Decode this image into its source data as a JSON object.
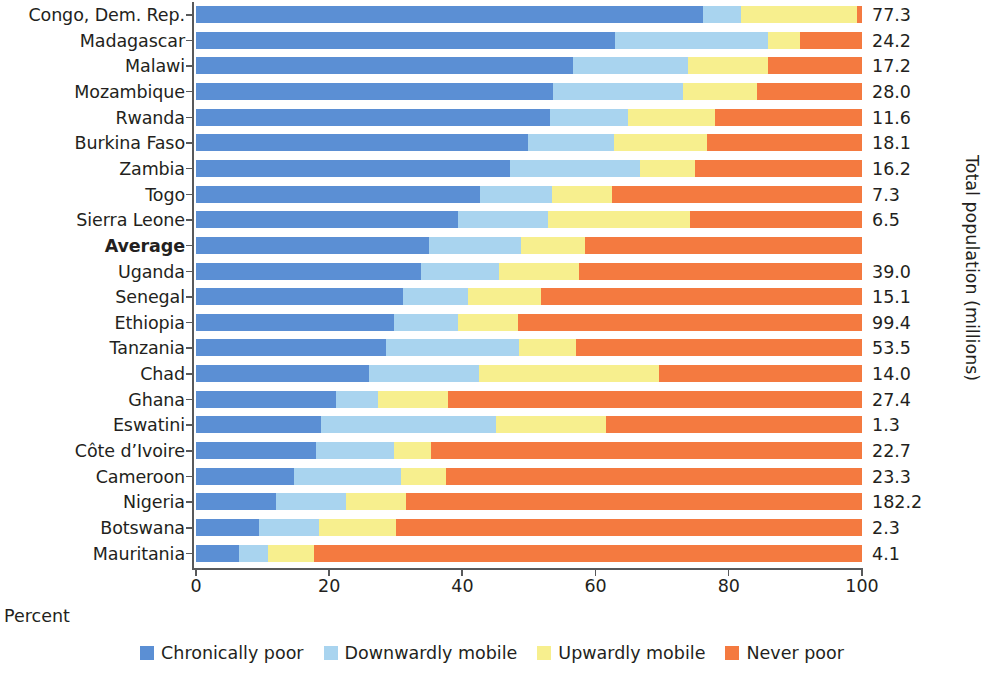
{
  "chart_data": {
    "type": "bar",
    "subtype": "horizontal-stacked-100",
    "title": "",
    "xlabel": "Percent",
    "ylabel": "",
    "y2label": "Total population (millions)",
    "xlim": [
      0,
      100
    ],
    "xticks": [
      0,
      20,
      40,
      60,
      80,
      100
    ],
    "xtick_labels": [
      "0",
      "20",
      "40",
      "60",
      "80",
      "100"
    ],
    "grid": false,
    "legend_position": "bottom",
    "colors": {
      "chronically_poor": "#5b8fd4",
      "downwardly_mobile": "#a9d4ef",
      "upwardly_mobile": "#f7ef8e",
      "never_poor": "#f47a40",
      "axis": "#58595b",
      "text": "#231f20"
    },
    "series": [
      {
        "name": "Chronically poor",
        "key": "chronically_poor",
        "color": "#5b8fd4"
      },
      {
        "name": "Downwardly mobile",
        "key": "downwardly_mobile",
        "color": "#a9d4ef"
      },
      {
        "name": "Upwardly mobile",
        "key": "upwardly_mobile",
        "color": "#f7ef8e"
      },
      {
        "name": "Never poor",
        "key": "never_poor",
        "color": "#f47a40"
      }
    ],
    "categories": [
      "Congo, Dem. Rep.",
      "Madagascar",
      "Malawi",
      "Mozambique",
      "Rwanda",
      "Burkina Faso",
      "Zambia",
      "Togo",
      "Sierra Leone",
      "Average",
      "Uganda",
      "Senegal",
      "Ethiopia",
      "Tanzania",
      "Chad",
      "Ghana",
      "Eswatini",
      "Côte d’Ivoire",
      "Cameroon",
      "Nigeria",
      "Botswana",
      "Mauritania"
    ],
    "rows": [
      {
        "label": "Congo, Dem. Rep.",
        "chronically_poor": 76.2,
        "downwardly_mobile": 5.7,
        "upwardly_mobile": 17.3,
        "never_poor": 0.8,
        "population": "77.3",
        "emphasis": false
      },
      {
        "label": "Madagascar",
        "chronically_poor": 62.9,
        "downwardly_mobile": 23.0,
        "upwardly_mobile": 4.8,
        "never_poor": 9.3,
        "population": "24.2",
        "emphasis": false
      },
      {
        "label": "Malawi",
        "chronically_poor": 56.6,
        "downwardly_mobile": 17.2,
        "upwardly_mobile": 12.1,
        "never_poor": 14.1,
        "population": "17.2",
        "emphasis": false
      },
      {
        "label": "Mozambique",
        "chronically_poor": 53.6,
        "downwardly_mobile": 19.5,
        "upwardly_mobile": 11.1,
        "never_poor": 15.8,
        "population": "28.0",
        "emphasis": false
      },
      {
        "label": "Rwanda",
        "chronically_poor": 53.2,
        "downwardly_mobile": 11.7,
        "upwardly_mobile": 13.0,
        "never_poor": 22.1,
        "population": "11.6",
        "emphasis": false
      },
      {
        "label": "Burkina Faso",
        "chronically_poor": 49.9,
        "downwardly_mobile": 12.9,
        "upwardly_mobile": 13.9,
        "never_poor": 23.3,
        "population": "18.1",
        "emphasis": false
      },
      {
        "label": "Zambia",
        "chronically_poor": 47.1,
        "downwardly_mobile": 19.6,
        "upwardly_mobile": 8.2,
        "never_poor": 25.1,
        "population": "16.2",
        "emphasis": false
      },
      {
        "label": "Togo",
        "chronically_poor": 42.6,
        "downwardly_mobile": 10.9,
        "upwardly_mobile": 9.0,
        "never_poor": 37.5,
        "population": "7.3",
        "emphasis": false
      },
      {
        "label": "Sierra Leone",
        "chronically_poor": 39.3,
        "downwardly_mobile": 13.6,
        "upwardly_mobile": 21.3,
        "never_poor": 25.8,
        "population": "6.5",
        "emphasis": false
      },
      {
        "label": "Average",
        "chronically_poor": 35.0,
        "downwardly_mobile": 13.8,
        "upwardly_mobile": 9.6,
        "never_poor": 41.6,
        "population": "",
        "emphasis": true
      },
      {
        "label": "Uganda",
        "chronically_poor": 33.8,
        "downwardly_mobile": 11.7,
        "upwardly_mobile": 12.0,
        "never_poor": 42.5,
        "population": "39.0",
        "emphasis": false
      },
      {
        "label": "Senegal",
        "chronically_poor": 31.1,
        "downwardly_mobile": 9.7,
        "upwardly_mobile": 11.0,
        "never_poor": 48.2,
        "population": "15.1",
        "emphasis": false
      },
      {
        "label": "Ethiopia",
        "chronically_poor": 29.7,
        "downwardly_mobile": 9.6,
        "upwardly_mobile": 9.0,
        "never_poor": 51.7,
        "population": "99.4",
        "emphasis": false
      },
      {
        "label": "Tanzania",
        "chronically_poor": 28.5,
        "downwardly_mobile": 20.0,
        "upwardly_mobile": 8.5,
        "never_poor": 43.0,
        "population": "53.5",
        "emphasis": false
      },
      {
        "label": "Chad",
        "chronically_poor": 26.0,
        "downwardly_mobile": 16.5,
        "upwardly_mobile": 27.0,
        "never_poor": 30.5,
        "population": "14.0",
        "emphasis": false
      },
      {
        "label": "Ghana",
        "chronically_poor": 21.0,
        "downwardly_mobile": 6.3,
        "upwardly_mobile": 10.5,
        "never_poor": 62.2,
        "population": "27.4",
        "emphasis": false
      },
      {
        "label": "Eswatini",
        "chronically_poor": 18.8,
        "downwardly_mobile": 26.2,
        "upwardly_mobile": 16.5,
        "never_poor": 38.5,
        "population": "1.3",
        "emphasis": false
      },
      {
        "label": "Côte d’Ivoire",
        "chronically_poor": 18.0,
        "downwardly_mobile": 11.7,
        "upwardly_mobile": 5.6,
        "never_poor": 64.7,
        "population": "22.7",
        "emphasis": false
      },
      {
        "label": "Cameroon",
        "chronically_poor": 14.7,
        "downwardly_mobile": 16.1,
        "upwardly_mobile": 6.7,
        "never_poor": 62.5,
        "population": "23.3",
        "emphasis": false
      },
      {
        "label": "Nigeria",
        "chronically_poor": 12.0,
        "downwardly_mobile": 10.5,
        "upwardly_mobile": 9.0,
        "never_poor": 68.5,
        "population": "182.2",
        "emphasis": false
      },
      {
        "label": "Botswana",
        "chronically_poor": 9.5,
        "downwardly_mobile": 9.0,
        "upwardly_mobile": 11.5,
        "never_poor": 70.0,
        "population": "2.3",
        "emphasis": false
      },
      {
        "label": "Mauritania",
        "chronically_poor": 6.5,
        "downwardly_mobile": 4.3,
        "upwardly_mobile": 6.9,
        "never_poor": 82.3,
        "population": "4.1",
        "emphasis": false
      }
    ]
  },
  "legend": {
    "items": [
      {
        "label": "Chronically poor",
        "color": "#5b8fd4",
        "icon": "square-swatch-icon"
      },
      {
        "label": "Downwardly mobile",
        "color": "#a9d4ef",
        "icon": "square-swatch-icon"
      },
      {
        "label": "Upwardly mobile",
        "color": "#f7ef8e",
        "icon": "square-swatch-icon"
      },
      {
        "label": "Never poor",
        "color": "#f47a40",
        "icon": "square-swatch-icon"
      }
    ]
  },
  "axes": {
    "x_title": "Percent",
    "y_right_title": "Total population (millions)",
    "x_ticks": [
      "0",
      "20",
      "40",
      "60",
      "80",
      "100"
    ]
  }
}
